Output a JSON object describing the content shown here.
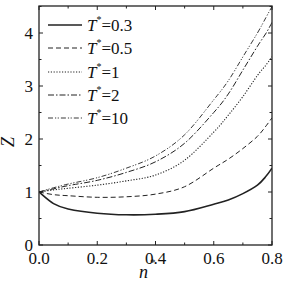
{
  "chart_data": {
    "type": "line",
    "title": "",
    "xlabel": "n*",
    "ylabel": "Z",
    "xlim": [
      0.0,
      0.8
    ],
    "ylim": [
      0,
      4.5
    ],
    "x_ticks": [
      "0.0",
      "0.2",
      "0.4",
      "0.6",
      "0.8"
    ],
    "y_ticks": [
      "0",
      "1",
      "2",
      "3",
      "4"
    ],
    "grid": false,
    "legend_position": "upper left",
    "x": [
      0.0,
      0.05,
      0.1,
      0.2,
      0.3,
      0.4,
      0.5,
      0.6,
      0.65,
      0.7,
      0.75,
      0.78,
      0.8
    ],
    "series": [
      {
        "name": "T*=0.3",
        "style": "solid",
        "values": [
          1.0,
          0.78,
          0.68,
          0.6,
          0.57,
          0.58,
          0.63,
          0.77,
          0.85,
          0.97,
          1.13,
          1.3,
          1.45
        ]
      },
      {
        "name": "T*=0.5",
        "style": "dashed",
        "values": [
          1.0,
          0.95,
          0.93,
          0.9,
          0.91,
          0.96,
          1.1,
          1.45,
          1.62,
          1.82,
          2.05,
          2.25,
          2.4
        ]
      },
      {
        "name": "T*=1",
        "style": "dotted",
        "values": [
          1.0,
          1.04,
          1.07,
          1.13,
          1.21,
          1.32,
          1.6,
          2.13,
          2.45,
          2.8,
          3.2,
          3.4,
          3.55
        ]
      },
      {
        "name": "T*=2",
        "style": "dashdot",
        "values": [
          1.0,
          1.06,
          1.12,
          1.22,
          1.37,
          1.57,
          1.92,
          2.5,
          2.85,
          3.3,
          3.75,
          4.0,
          4.2
        ]
      },
      {
        "name": "T*=10",
        "style": "dashdotdot",
        "values": [
          1.0,
          1.08,
          1.15,
          1.27,
          1.45,
          1.68,
          2.08,
          2.74,
          3.1,
          3.55,
          4.0,
          4.3,
          4.5
        ]
      }
    ]
  },
  "legend": {
    "items": [
      {
        "prefix": "T",
        "sup": "*",
        "suffix": "=0.3"
      },
      {
        "prefix": "T",
        "sup": "*",
        "suffix": "=0.5"
      },
      {
        "prefix": "T",
        "sup": "*",
        "suffix": "=1"
      },
      {
        "prefix": "T",
        "sup": "*",
        "suffix": "=2"
      },
      {
        "prefix": "T",
        "sup": "*",
        "suffix": "=10"
      }
    ]
  },
  "axes": {
    "xlabel_main": "n",
    "xlabel_sup": "*",
    "ylabel": "Z"
  }
}
